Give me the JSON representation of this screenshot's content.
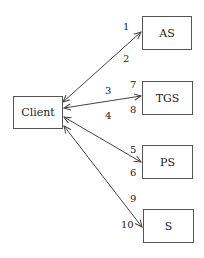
{
  "diagram": {
    "type": "network-message-flow",
    "colors": {
      "line": "#444444",
      "box_border": "#555555",
      "text": "#222222",
      "background": "#ffffff"
    },
    "nodes": [
      {
        "id": "client",
        "label": "Client"
      },
      {
        "id": "as",
        "label": "AS"
      },
      {
        "id": "tgs",
        "label": "TGS"
      },
      {
        "id": "ps",
        "label": "PS"
      },
      {
        "id": "s",
        "label": "S"
      }
    ],
    "edges": [
      {
        "from": "client",
        "to": "as",
        "bidirectional": true,
        "labels": [
          "1",
          "2"
        ]
      },
      {
        "from": "client",
        "to": "tgs",
        "bidirectional": true,
        "labels": [
          "3",
          "4",
          "7",
          "8"
        ]
      },
      {
        "from": "client",
        "to": "ps",
        "bidirectional": true,
        "labels": [
          "5",
          "6"
        ]
      },
      {
        "from": "client",
        "to": "s",
        "bidirectional": true,
        "labels": [
          "9",
          "10"
        ]
      }
    ],
    "labels": {
      "m1": "1",
      "m2": "2",
      "m3": "3",
      "m4": "4",
      "m5": "5",
      "m6": "6",
      "m7": "7",
      "m8": "8",
      "m9": "9",
      "m10": "10"
    }
  }
}
